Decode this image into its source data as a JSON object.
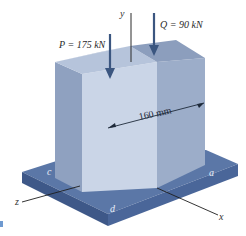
{
  "figure": {
    "loads": [
      {
        "symbol": "P",
        "label": "P = 175 kN",
        "value": 175,
        "unit": "kN"
      },
      {
        "symbol": "Q",
        "label": "Q = 90 kN",
        "value": 90,
        "unit": "kN"
      }
    ],
    "dimension": {
      "label": "160 mm",
      "value": 160,
      "unit": "mm"
    },
    "axes": {
      "x": "x",
      "y": "y",
      "z": "z"
    },
    "corners": {
      "a": "a",
      "c": "c",
      "d": "d"
    },
    "colors": {
      "block_front": "#c9d4e6",
      "block_right": "#9aabc7",
      "block_left": "#8d9fbe",
      "block_top_light": "#b9c6dc",
      "block_top_dark": "#8fa1bf",
      "plate_top": "#5a76a6",
      "plate_side_front": "#3f5a8a",
      "plate_side_right": "#4b679a",
      "arrow": "#3b5680",
      "axis_line": "#1e1e1e"
    }
  }
}
